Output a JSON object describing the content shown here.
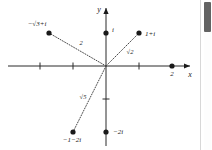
{
  "figure": {
    "kind": "argand-diagram",
    "axes": {
      "x_label": "x",
      "y_label": "y",
      "x_ticks": [
        "-2",
        "-1",
        "1"
      ],
      "y_ticks": [
        "-1"
      ]
    },
    "points": [
      {
        "id": "minus-sqrt3-plus-i",
        "label": "−√3+i",
        "x": -1.732,
        "y": 1
      },
      {
        "id": "i",
        "label": "i",
        "x": 0,
        "y": 1
      },
      {
        "id": "one-plus-i",
        "label": "1+i",
        "x": 1,
        "y": 1
      },
      {
        "id": "two",
        "label": "2",
        "x": 2,
        "y": 0
      },
      {
        "id": "minus-one-minus-two-i",
        "label": "−1−2i",
        "x": -1,
        "y": -2
      },
      {
        "id": "minus-two-i",
        "label": "−2i",
        "x": 0,
        "y": -2
      }
    ],
    "modulus_lines": [
      {
        "id": "mod-2",
        "label": "2",
        "to": "minus-sqrt3-plus-i"
      },
      {
        "id": "mod-sqrt2",
        "label": "√2",
        "to": "one-plus-i"
      },
      {
        "id": "mod-sqrt5",
        "label": "√5",
        "to": "minus-one-minus-two-i"
      }
    ],
    "colors": {
      "axis": "#2b2b2b",
      "point": "#1a1a1a",
      "dotted": "#4a4a4a",
      "background": "#ffffff"
    }
  },
  "scrollbar": {
    "thumb_color": "#636363",
    "track_color": "#fdfdfd"
  }
}
